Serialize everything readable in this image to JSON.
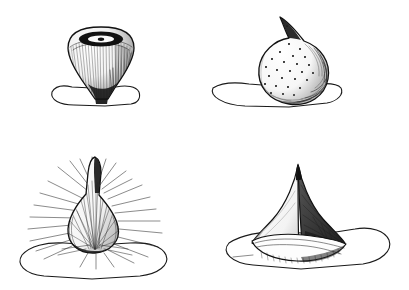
{
  "plate": {
    "title": "Ink Illustration Plate",
    "medium": "pen-and-ink line drawing",
    "background_color": "#ffffff",
    "ink_color": "#111111",
    "width": 409,
    "height": 290,
    "layout": "2x2 grid of figures",
    "figure_count": 4,
    "has_text_labels": false,
    "caption": ""
  },
  "figures": [
    {
      "id": "figure-top-left",
      "position": "top-left",
      "form_name": "inverted-cone-with-apical-crater",
      "description": "Downward-tapering conical body with a broad rounded dome top bearing a dark elliptical crater and a pale central highlight; dense vertical hatching on the body.",
      "texture": "fine vertical hatching",
      "shading_side": "right",
      "apex_feature": "dark elliptical crater with pale center",
      "substrate_shape": "irregular flat quadrilateral slab",
      "stem_visible": true,
      "cell_origin": [
        0,
        0
      ]
    },
    {
      "id": "figure-top-right",
      "position": "top-right",
      "form_name": "globose-body-with-pointed-beak",
      "description": "Rounded globose body with a narrow pointed beak projecting from the upper left-of-center, surface scattered with small dark punctate dots; heavy stipple shading along the right and lower margins.",
      "texture": "scattered punctate dots",
      "shading_side": "right and lower margin",
      "apex_feature": "slender pointed beak",
      "substrate_shape": "irregular flat pentagonal slab",
      "stem_visible": false,
      "cell_origin": [
        205,
        0
      ]
    },
    {
      "id": "figure-bottom-left",
      "position": "bottom-left",
      "form_name": "pyriform-body-with-radiating-setae",
      "description": "Pear-shaped body drawn out into a slender curved neck, entirely clothed in long radiating hair-like setae that project well beyond the outline in all directions.",
      "texture": "long radiating setae / hairs",
      "shading_side": "lower and left margin",
      "apex_feature": "slender curved tapering neck",
      "substrate_shape": "broad irregular flat slab",
      "stem_visible": false,
      "cell_origin": [
        0,
        145
      ]
    },
    {
      "id": "figure-bottom-right",
      "position": "bottom-right",
      "form_name": "tetrahedral-body-with-recurved-rim",
      "description": "Four-sided pyramidal body with concave curved faces rising to a narrow apex; the dark right face is densely stippled, the pale left face is lightly shaded, and the lower margin flares out into a recurved lip.",
      "texture": "dense stipple on shaded face",
      "shading_side": "right face",
      "apex_feature": "narrow pointed apex",
      "substrate_shape": "irregular flat angular slab",
      "stem_visible": false,
      "cell_origin": [
        205,
        145
      ]
    }
  ]
}
